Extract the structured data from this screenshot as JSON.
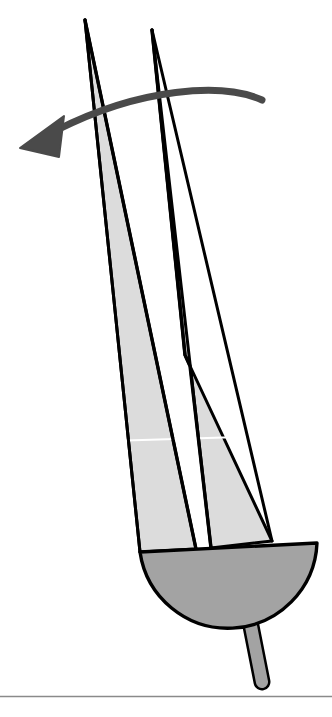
{
  "figure": {
    "title": "Two-bladed rotor with rotation direction arrow",
    "canvas": {
      "width": 332,
      "height": 717,
      "background": "#ffffff"
    },
    "colors": {
      "outline": "#000000",
      "blade_fill": "#dcdcdc",
      "hub_fill": "#a3a3a3",
      "stem_fill": "#a3a3a3",
      "arrow": "#4a4a4a",
      "baseline": "#8a8a8a",
      "highlight_line": "#ffffff"
    },
    "parts": [
      {
        "name": "left-blade",
        "label": "Left blade",
        "fill": "#dcdcdc",
        "stroke": "#000000",
        "stroke_width": 3,
        "points": "85,20 196,549 140,552"
      },
      {
        "name": "right-blade",
        "label": "Right blade",
        "fill": "#dcdcdc",
        "stroke": "#000000",
        "stroke_width": 3,
        "points": "152,30 185,355 190,366 272,541 211,548"
      },
      {
        "name": "blade-spar-left",
        "label": "Left blade spar",
        "stroke": "#000000",
        "stroke_width": 3,
        "path": "M 85,20 L 196,549"
      },
      {
        "name": "blade-spar-right",
        "label": "Right blade spar",
        "stroke": "#000000",
        "stroke_width": 3,
        "path": "M 152,30 L 185,355 L 190,366 L 211,548"
      },
      {
        "name": "hub-semicircle",
        "label": "Hub",
        "fill": "#a3a3a3",
        "stroke": "#000000",
        "stroke_width": 3,
        "path": "M 140,552 L 317,543 A 90 90 0 0 1 140,552 Z"
      },
      {
        "name": "stem",
        "label": "Stem / shaft",
        "fill": "#a3a3a3",
        "stroke": "#000000",
        "stroke_width": 3,
        "path": "M 249,616 L 262,682"
      },
      {
        "name": "rotation-arrow",
        "label": "Rotation direction arrow",
        "color": "#4a4a4a",
        "arc_path": "M 262,100 C 215,83 130,92 49,133",
        "head_points": "22,148 60,120 58,155"
      },
      {
        "name": "chord-highlight-line",
        "label": "Chord highlight line",
        "color": "#ffffff",
        "path": "M 110,441 L 262,437"
      },
      {
        "name": "ground-baseline",
        "label": "Ground baseline",
        "color": "#8a8a8a",
        "path": "M 0,696 L 332,696"
      }
    ]
  }
}
